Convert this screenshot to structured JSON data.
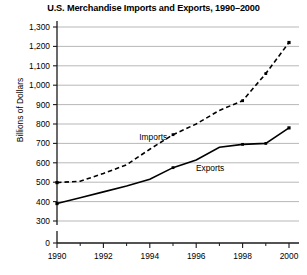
{
  "figure": {
    "title": "U.S. Merchandise Imports and Exports, 1990–2000",
    "y_axis_title": "Billions of Dollars"
  },
  "chart_data": {
    "type": "line",
    "title": "U.S. Merchandise Imports and Exports, 1990–2000",
    "subtitle": "",
    "xlabel": "",
    "ylabel": "Billions of Dollars",
    "x": [
      1990,
      1991,
      1992,
      1993,
      1994,
      1995,
      1996,
      1997,
      1998,
      1999,
      2000
    ],
    "xlim": [
      1990,
      2000
    ],
    "ylim": [
      300,
      1300
    ],
    "y_axis_break": true,
    "y_axis_break_note": "Axis is broken between 0 and 300",
    "ytick_labels": [
      "0",
      "300",
      "400",
      "500",
      "600",
      "700",
      "800",
      "900",
      "1,000",
      "1,100",
      "1,200",
      "1,300"
    ],
    "ytick_values": [
      0,
      300,
      400,
      500,
      600,
      700,
      800,
      900,
      1000,
      1100,
      1200,
      1300
    ],
    "xtick_labels": [
      "1990",
      "1992",
      "1994",
      "1996",
      "1998",
      "2000"
    ],
    "xtick_values": [
      1990,
      1992,
      1994,
      1996,
      1998,
      2000
    ],
    "x_minor_ticks": [
      1991,
      1993,
      1995,
      1997,
      1999
    ],
    "grid": "horizontal",
    "legend_position": "inline-annotations",
    "series": [
      {
        "name": "Imports",
        "style": "dashed",
        "color": "#000000",
        "values": [
          498,
          505,
          545,
          590,
          670,
          745,
          800,
          870,
          920,
          1060,
          1220
        ]
      },
      {
        "name": "Exports",
        "style": "solid",
        "color": "#000000",
        "values": [
          390,
          420,
          450,
          480,
          515,
          575,
          615,
          680,
          695,
          700,
          780
        ]
      }
    ],
    "annotations": [
      {
        "text": "Imports",
        "x": 1994.15,
        "y": 720
      },
      {
        "text": "Exports",
        "x": 1996.6,
        "y": 560
      }
    ]
  }
}
